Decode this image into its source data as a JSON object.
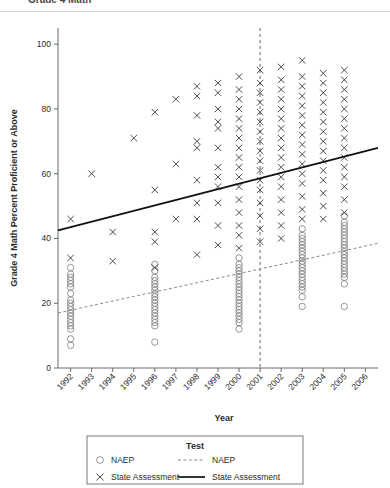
{
  "page": {
    "truncated_header": "Grade 4 Math"
  },
  "chart_data": {
    "type": "scatter",
    "title": "",
    "xlabel": "Year",
    "ylabel": "Grade 4 Math Percent Proficient or Above",
    "xlim": [
      1991.4,
      2006.6
    ],
    "ylim": [
      0,
      105
    ],
    "yticks": [
      0,
      20,
      40,
      60,
      80,
      100
    ],
    "ytick_labels": [
      "0",
      "20",
      "40",
      "60",
      "80",
      "100"
    ],
    "xticks": [
      1992,
      1993,
      1994,
      1995,
      1996,
      1997,
      1998,
      1999,
      2000,
      2001,
      2002,
      2003,
      2004,
      2005,
      2006
    ],
    "xtick_labels": [
      "1992",
      "1993",
      "1994",
      "1995",
      "1996",
      "1997",
      "1998",
      "1999",
      "2000",
      "2001",
      "2002",
      "2003",
      "2004",
      "2005",
      "2006"
    ],
    "grid": false,
    "legend_position": "bottom",
    "legend_title": "Test",
    "annotations": [
      {
        "type": "vline",
        "x": 2001,
        "style": "dashed",
        "label": "2001"
      }
    ],
    "series": [
      {
        "name": "NAEP",
        "marker": "circle",
        "trend_style": "dashed",
        "trend_endpoints": [
          {
            "x": 1991.4,
            "y": 17.0
          },
          {
            "x": 2006.6,
            "y": 38.5
          }
        ],
        "points": [
          {
            "x": 1992,
            "y": 31
          },
          {
            "x": 1992,
            "y": 29
          },
          {
            "x": 1992,
            "y": 28
          },
          {
            "x": 1992,
            "y": 27
          },
          {
            "x": 1992,
            "y": 26
          },
          {
            "x": 1992,
            "y": 25
          },
          {
            "x": 1992,
            "y": 23
          },
          {
            "x": 1992,
            "y": 21
          },
          {
            "x": 1992,
            "y": 20
          },
          {
            "x": 1992,
            "y": 19
          },
          {
            "x": 1992,
            "y": 18
          },
          {
            "x": 1992,
            "y": 17
          },
          {
            "x": 1992,
            "y": 16
          },
          {
            "x": 1992,
            "y": 15
          },
          {
            "x": 1992,
            "y": 14
          },
          {
            "x": 1992,
            "y": 13
          },
          {
            "x": 1992,
            "y": 12
          },
          {
            "x": 1992,
            "y": 9
          },
          {
            "x": 1992,
            "y": 7
          },
          {
            "x": 1996,
            "y": 32
          },
          {
            "x": 1996,
            "y": 30
          },
          {
            "x": 1996,
            "y": 28
          },
          {
            "x": 1996,
            "y": 27
          },
          {
            "x": 1996,
            "y": 26
          },
          {
            "x": 1996,
            "y": 25
          },
          {
            "x": 1996,
            "y": 24
          },
          {
            "x": 1996,
            "y": 23
          },
          {
            "x": 1996,
            "y": 22
          },
          {
            "x": 1996,
            "y": 21
          },
          {
            "x": 1996,
            "y": 20
          },
          {
            "x": 1996,
            "y": 19
          },
          {
            "x": 1996,
            "y": 18
          },
          {
            "x": 1996,
            "y": 17
          },
          {
            "x": 1996,
            "y": 16
          },
          {
            "x": 1996,
            "y": 15
          },
          {
            "x": 1996,
            "y": 14
          },
          {
            "x": 1996,
            "y": 13
          },
          {
            "x": 1996,
            "y": 8
          },
          {
            "x": 2000,
            "y": 34
          },
          {
            "x": 2000,
            "y": 32
          },
          {
            "x": 2000,
            "y": 31
          },
          {
            "x": 2000,
            "y": 30
          },
          {
            "x": 2000,
            "y": 29
          },
          {
            "x": 2000,
            "y": 28
          },
          {
            "x": 2000,
            "y": 27
          },
          {
            "x": 2000,
            "y": 26
          },
          {
            "x": 2000,
            "y": 25
          },
          {
            "x": 2000,
            "y": 24
          },
          {
            "x": 2000,
            "y": 23
          },
          {
            "x": 2000,
            "y": 22
          },
          {
            "x": 2000,
            "y": 21
          },
          {
            "x": 2000,
            "y": 20
          },
          {
            "x": 2000,
            "y": 19
          },
          {
            "x": 2000,
            "y": 18
          },
          {
            "x": 2000,
            "y": 17
          },
          {
            "x": 2000,
            "y": 16
          },
          {
            "x": 2000,
            "y": 15
          },
          {
            "x": 2000,
            "y": 14
          },
          {
            "x": 2000,
            "y": 12
          },
          {
            "x": 2003,
            "y": 43
          },
          {
            "x": 2003,
            "y": 41
          },
          {
            "x": 2003,
            "y": 40
          },
          {
            "x": 2003,
            "y": 39
          },
          {
            "x": 2003,
            "y": 38
          },
          {
            "x": 2003,
            "y": 37
          },
          {
            "x": 2003,
            "y": 36
          },
          {
            "x": 2003,
            "y": 35
          },
          {
            "x": 2003,
            "y": 34
          },
          {
            "x": 2003,
            "y": 33
          },
          {
            "x": 2003,
            "y": 32
          },
          {
            "x": 2003,
            "y": 31
          },
          {
            "x": 2003,
            "y": 30
          },
          {
            "x": 2003,
            "y": 29
          },
          {
            "x": 2003,
            "y": 28
          },
          {
            "x": 2003,
            "y": 27
          },
          {
            "x": 2003,
            "y": 26
          },
          {
            "x": 2003,
            "y": 25
          },
          {
            "x": 2003,
            "y": 24
          },
          {
            "x": 2003,
            "y": 22
          },
          {
            "x": 2003,
            "y": 19
          },
          {
            "x": 2005,
            "y": 47
          },
          {
            "x": 2005,
            "y": 45
          },
          {
            "x": 2005,
            "y": 44
          },
          {
            "x": 2005,
            "y": 43
          },
          {
            "x": 2005,
            "y": 42
          },
          {
            "x": 2005,
            "y": 41
          },
          {
            "x": 2005,
            "y": 40
          },
          {
            "x": 2005,
            "y": 39
          },
          {
            "x": 2005,
            "y": 38
          },
          {
            "x": 2005,
            "y": 37
          },
          {
            "x": 2005,
            "y": 36
          },
          {
            "x": 2005,
            "y": 35
          },
          {
            "x": 2005,
            "y": 34
          },
          {
            "x": 2005,
            "y": 33
          },
          {
            "x": 2005,
            "y": 32
          },
          {
            "x": 2005,
            "y": 31
          },
          {
            "x": 2005,
            "y": 30
          },
          {
            "x": 2005,
            "y": 29
          },
          {
            "x": 2005,
            "y": 28
          },
          {
            "x": 2005,
            "y": 26
          },
          {
            "x": 2005,
            "y": 19
          }
        ]
      },
      {
        "name": "State Assessment",
        "marker": "x",
        "trend_style": "solid",
        "trend_endpoints": [
          {
            "x": 1991.4,
            "y": 42.5
          },
          {
            "x": 2006.6,
            "y": 68.0
          }
        ],
        "points": [
          {
            "x": 1992,
            "y": 46
          },
          {
            "x": 1992,
            "y": 34
          },
          {
            "x": 1993,
            "y": 60
          },
          {
            "x": 1994,
            "y": 42
          },
          {
            "x": 1994,
            "y": 33
          },
          {
            "x": 1995,
            "y": 71
          },
          {
            "x": 1996,
            "y": 79
          },
          {
            "x": 1996,
            "y": 55
          },
          {
            "x": 1996,
            "y": 42
          },
          {
            "x": 1996,
            "y": 39
          },
          {
            "x": 1996,
            "y": 31
          },
          {
            "x": 1997,
            "y": 83
          },
          {
            "x": 1997,
            "y": 63
          },
          {
            "x": 1997,
            "y": 46
          },
          {
            "x": 1998,
            "y": 87
          },
          {
            "x": 1998,
            "y": 84
          },
          {
            "x": 1998,
            "y": 78
          },
          {
            "x": 1998,
            "y": 70
          },
          {
            "x": 1998,
            "y": 68
          },
          {
            "x": 1998,
            "y": 58
          },
          {
            "x": 1998,
            "y": 51
          },
          {
            "x": 1998,
            "y": 46
          },
          {
            "x": 1998,
            "y": 35
          },
          {
            "x": 1999,
            "y": 88
          },
          {
            "x": 1999,
            "y": 85
          },
          {
            "x": 1999,
            "y": 80
          },
          {
            "x": 1999,
            "y": 76
          },
          {
            "x": 1999,
            "y": 74
          },
          {
            "x": 1999,
            "y": 68
          },
          {
            "x": 1999,
            "y": 62
          },
          {
            "x": 1999,
            "y": 59
          },
          {
            "x": 1999,
            "y": 56
          },
          {
            "x": 1999,
            "y": 51
          },
          {
            "x": 1999,
            "y": 44
          },
          {
            "x": 1999,
            "y": 38
          },
          {
            "x": 2000,
            "y": 90
          },
          {
            "x": 2000,
            "y": 86
          },
          {
            "x": 2000,
            "y": 83
          },
          {
            "x": 2000,
            "y": 80
          },
          {
            "x": 2000,
            "y": 77
          },
          {
            "x": 2000,
            "y": 74
          },
          {
            "x": 2000,
            "y": 71
          },
          {
            "x": 2000,
            "y": 68
          },
          {
            "x": 2000,
            "y": 65
          },
          {
            "x": 2000,
            "y": 62
          },
          {
            "x": 2000,
            "y": 59
          },
          {
            "x": 2000,
            "y": 56
          },
          {
            "x": 2000,
            "y": 52
          },
          {
            "x": 2000,
            "y": 48
          },
          {
            "x": 2000,
            "y": 44
          },
          {
            "x": 2000,
            "y": 41
          },
          {
            "x": 2000,
            "y": 37
          },
          {
            "x": 2001,
            "y": 92
          },
          {
            "x": 2001,
            "y": 88
          },
          {
            "x": 2001,
            "y": 85
          },
          {
            "x": 2001,
            "y": 82
          },
          {
            "x": 2001,
            "y": 79
          },
          {
            "x": 2001,
            "y": 76
          },
          {
            "x": 2001,
            "y": 73
          },
          {
            "x": 2001,
            "y": 70
          },
          {
            "x": 2001,
            "y": 67
          },
          {
            "x": 2001,
            "y": 64
          },
          {
            "x": 2001,
            "y": 61
          },
          {
            "x": 2001,
            "y": 58
          },
          {
            "x": 2001,
            "y": 55
          },
          {
            "x": 2001,
            "y": 51
          },
          {
            "x": 2001,
            "y": 47
          },
          {
            "x": 2001,
            "y": 43
          },
          {
            "x": 2001,
            "y": 39
          },
          {
            "x": 2002,
            "y": 93
          },
          {
            "x": 2002,
            "y": 89
          },
          {
            "x": 2002,
            "y": 86
          },
          {
            "x": 2002,
            "y": 83
          },
          {
            "x": 2002,
            "y": 80
          },
          {
            "x": 2002,
            "y": 77
          },
          {
            "x": 2002,
            "y": 74
          },
          {
            "x": 2002,
            "y": 71
          },
          {
            "x": 2002,
            "y": 68
          },
          {
            "x": 2002,
            "y": 65
          },
          {
            "x": 2002,
            "y": 62
          },
          {
            "x": 2002,
            "y": 59
          },
          {
            "x": 2002,
            "y": 56
          },
          {
            "x": 2002,
            "y": 52
          },
          {
            "x": 2002,
            "y": 48
          },
          {
            "x": 2002,
            "y": 44
          },
          {
            "x": 2002,
            "y": 40
          },
          {
            "x": 2003,
            "y": 95
          },
          {
            "x": 2003,
            "y": 90
          },
          {
            "x": 2003,
            "y": 87
          },
          {
            "x": 2003,
            "y": 84
          },
          {
            "x": 2003,
            "y": 81
          },
          {
            "x": 2003,
            "y": 78
          },
          {
            "x": 2003,
            "y": 75
          },
          {
            "x": 2003,
            "y": 72
          },
          {
            "x": 2003,
            "y": 69
          },
          {
            "x": 2003,
            "y": 66
          },
          {
            "x": 2003,
            "y": 63
          },
          {
            "x": 2003,
            "y": 60
          },
          {
            "x": 2003,
            "y": 57
          },
          {
            "x": 2003,
            "y": 53
          },
          {
            "x": 2003,
            "y": 49
          },
          {
            "x": 2003,
            "y": 46
          },
          {
            "x": 2004,
            "y": 91
          },
          {
            "x": 2004,
            "y": 88
          },
          {
            "x": 2004,
            "y": 85
          },
          {
            "x": 2004,
            "y": 82
          },
          {
            "x": 2004,
            "y": 79
          },
          {
            "x": 2004,
            "y": 76
          },
          {
            "x": 2004,
            "y": 73
          },
          {
            "x": 2004,
            "y": 70
          },
          {
            "x": 2004,
            "y": 67
          },
          {
            "x": 2004,
            "y": 64
          },
          {
            "x": 2004,
            "y": 61
          },
          {
            "x": 2004,
            "y": 58
          },
          {
            "x": 2004,
            "y": 54
          },
          {
            "x": 2004,
            "y": 50
          },
          {
            "x": 2004,
            "y": 46
          },
          {
            "x": 2005,
            "y": 92
          },
          {
            "x": 2005,
            "y": 89
          },
          {
            "x": 2005,
            "y": 86
          },
          {
            "x": 2005,
            "y": 83
          },
          {
            "x": 2005,
            "y": 80
          },
          {
            "x": 2005,
            "y": 77
          },
          {
            "x": 2005,
            "y": 74
          },
          {
            "x": 2005,
            "y": 71
          },
          {
            "x": 2005,
            "y": 68
          },
          {
            "x": 2005,
            "y": 65
          },
          {
            "x": 2005,
            "y": 62
          },
          {
            "x": 2005,
            "y": 59
          },
          {
            "x": 2005,
            "y": 56
          },
          {
            "x": 2005,
            "y": 52
          },
          {
            "x": 2005,
            "y": 48
          }
        ]
      }
    ]
  },
  "legend": {
    "title": "Test",
    "rows": [
      {
        "marker_label": "NAEP",
        "line_label": "NAEP"
      },
      {
        "marker_label": "State Assessment",
        "line_label": "State Assessment"
      }
    ]
  }
}
